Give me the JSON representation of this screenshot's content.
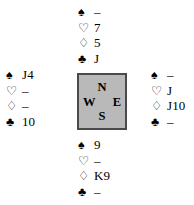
{
  "diagram": {
    "type": "bridge-hand-diagram",
    "background_color": "#ffffff",
    "text_color": "#000000"
  },
  "suit_symbols": {
    "spade": "♠",
    "heart": "♡",
    "diamond": "♢",
    "club": "♣"
  },
  "void": "–",
  "compass": {
    "north": "N",
    "west": "W",
    "east": "E",
    "south": "S",
    "fill_color": "#b9b9b9",
    "border_color": "#4a4a4a"
  },
  "hands": {
    "north": {
      "position": "North",
      "spades": "–",
      "hearts": "7",
      "diamonds": "5",
      "clubs": "J"
    },
    "west": {
      "position": "West",
      "spades": "J4",
      "hearts": "–",
      "diamonds": "–",
      "clubs": "10"
    },
    "east": {
      "position": "East",
      "spades": "–",
      "hearts": "J",
      "diamonds": "J10",
      "clubs": "–"
    },
    "south": {
      "position": "South",
      "spades": "9",
      "hearts": "–",
      "diamonds": "K9",
      "clubs": "–"
    }
  }
}
